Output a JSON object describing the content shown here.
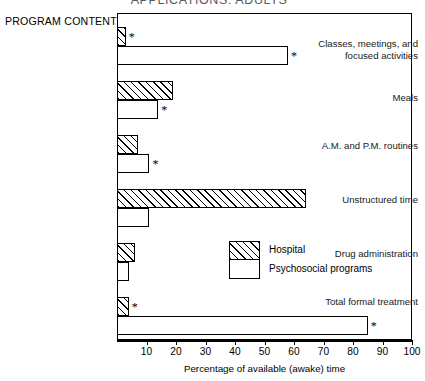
{
  "title": "APPLICATIONS: ADULTS",
  "axis_title_left": "PROGRAM CONTENT",
  "legend": {
    "hospital": "Hospital",
    "psychosocial": "Psychosocial programs"
  },
  "chart_data": {
    "type": "bar",
    "orientation": "horizontal",
    "title": "APPLICATIONS: ADULTS",
    "xlabel": "Percentage of available (awake) time",
    "ylabel": "PROGRAM CONTENT",
    "xlim": [
      0,
      100
    ],
    "xticks": [
      0,
      10,
      20,
      30,
      40,
      50,
      60,
      70,
      80,
      90,
      100
    ],
    "xticklabels": [
      "",
      "10",
      "20",
      "30",
      "40",
      "50",
      "60",
      "70",
      "80",
      "90",
      "100"
    ],
    "grid": false,
    "legend_position": "center-right",
    "annotation_note": "* denotes statistically significant difference",
    "categories": [
      "Classes, meetings, and focused activities",
      "Meals",
      "A.M. and P.M. routines",
      "Unstructured time",
      "Drug administration",
      "Total formal treatment"
    ],
    "series": [
      {
        "name": "Hospital",
        "pattern": "hatched",
        "values": [
          3,
          19,
          7,
          64,
          6,
          4
        ],
        "starred": [
          true,
          false,
          false,
          false,
          false,
          true
        ]
      },
      {
        "name": "Psychosocial programs",
        "pattern": "open",
        "values": [
          58,
          14,
          11,
          11,
          4,
          85
        ],
        "starred": [
          true,
          true,
          true,
          false,
          false,
          true
        ]
      }
    ]
  }
}
